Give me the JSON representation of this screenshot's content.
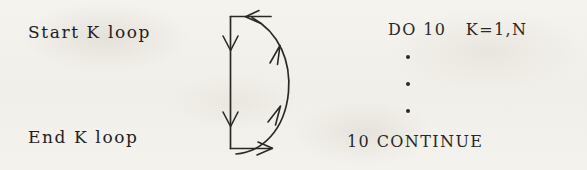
{
  "figure": {
    "background_color": "#f3f1ec",
    "ink_color": "#23211f"
  },
  "labels": {
    "start_loop": "Start K loop",
    "end_loop": "End K loop"
  },
  "code": {
    "do_statement": "DO 10   K=1,N",
    "continue_statement": "10 CONTINUE",
    "ellipsis_dots": [
      "•",
      "•",
      "•"
    ]
  },
  "diagram": {
    "arrow_color": "#2b2926",
    "elements": [
      "top-horizontal-inbound-arrow",
      "left-vertical-downward-arrow-upper",
      "left-vertical-downward-arrow-lower",
      "bottom-horizontal-outbound-arrow",
      "right-curved-return-arrow-upper",
      "right-curved-return-arrow-lower"
    ]
  }
}
